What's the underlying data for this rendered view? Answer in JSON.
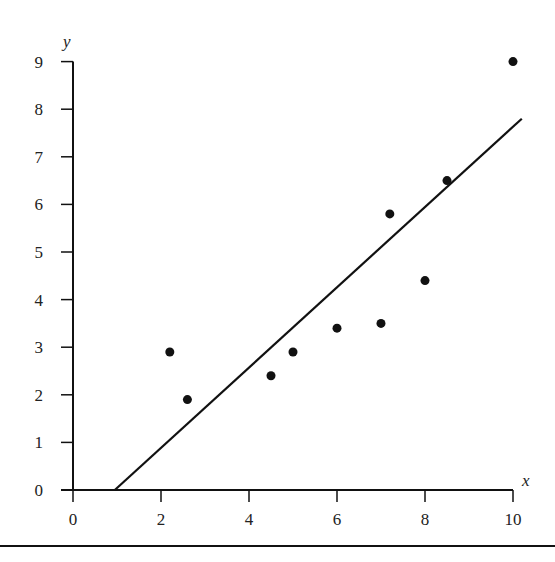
{
  "chart_data": {
    "type": "scatter",
    "title": "",
    "xlabel": "x",
    "ylabel": "y",
    "xlim": [
      0,
      10
    ],
    "ylim": [
      0,
      9
    ],
    "x_ticks": [
      0,
      2,
      4,
      6,
      8,
      10
    ],
    "y_ticks": [
      0,
      1,
      2,
      3,
      4,
      5,
      6,
      7,
      8,
      9
    ],
    "grid": false,
    "legend": null,
    "series": [
      {
        "name": "data points",
        "type": "scatter",
        "points": [
          {
            "x": 2.2,
            "y": 2.9
          },
          {
            "x": 2.6,
            "y": 1.9
          },
          {
            "x": 4.5,
            "y": 2.4
          },
          {
            "x": 5.0,
            "y": 2.9
          },
          {
            "x": 6.0,
            "y": 3.4
          },
          {
            "x": 7.0,
            "y": 3.5
          },
          {
            "x": 7.2,
            "y": 5.8
          },
          {
            "x": 8.0,
            "y": 4.4
          },
          {
            "x": 8.5,
            "y": 6.5
          },
          {
            "x": 10.0,
            "y": 9.0
          }
        ]
      },
      {
        "name": "fitted line",
        "type": "line",
        "points": [
          {
            "x": 0.95,
            "y": 0.0
          },
          {
            "x": 10.2,
            "y": 7.8
          }
        ]
      }
    ],
    "colors": {
      "ink": "#111111",
      "text": "#222222",
      "background": "#ffffff"
    }
  }
}
